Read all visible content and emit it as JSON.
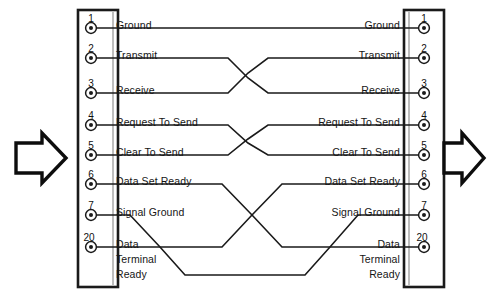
{
  "diagram": {
    "type": "null-modem-crossover-wiring",
    "background_color": "#ffffff",
    "line_color": "#1a1a1a",
    "text_color": "#151515"
  },
  "left_connector": {
    "name": "left-connector",
    "label": "DB-25 Connector (left)",
    "x": 78,
    "y": 10,
    "width": 40,
    "height": 277
  },
  "right_connector": {
    "name": "right-connector",
    "label": "DB-25 Connector (right)",
    "x": 404,
    "y": 10,
    "width": 40,
    "height": 277
  },
  "arrows": {
    "left": {
      "name": "left-direction-arrow",
      "direction": "right",
      "x": 14,
      "y": 133
    },
    "right": {
      "name": "right-direction-arrow",
      "direction": "right",
      "x": 440,
      "y": 133
    }
  },
  "pins": [
    {
      "number": "1",
      "label": "Ground",
      "y": 28,
      "multiline": false
    },
    {
      "number": "2",
      "label": "Transmit",
      "y": 58,
      "multiline": false
    },
    {
      "number": "3",
      "label": "Receive",
      "y": 93,
      "multiline": false
    },
    {
      "number": "4",
      "label": "Request To Send",
      "y": 125,
      "multiline": false
    },
    {
      "number": "5",
      "label": "Clear To Send",
      "y": 155,
      "multiline": false
    },
    {
      "number": "6",
      "label": "Data Set Ready",
      "y": 184,
      "multiline": false
    },
    {
      "number": "7",
      "label": "Signal Ground",
      "y": 215,
      "multiline": false
    },
    {
      "number": "20",
      "label": "Data Terminal Ready",
      "y": 247,
      "multiline": true,
      "lines": [
        "Data",
        "Terminal",
        "Ready"
      ]
    }
  ],
  "connections": [
    {
      "name": "wire-ground",
      "from_pin": "1",
      "to_pin": "1",
      "crossed": false
    },
    {
      "name": "wire-transmit",
      "from_pin": "2",
      "to_pin": "3",
      "crossed": true
    },
    {
      "name": "wire-receive",
      "from_pin": "3",
      "to_pin": "2",
      "crossed": true
    },
    {
      "name": "wire-request-to-send",
      "from_pin": "4",
      "to_pin": "5",
      "crossed": true
    },
    {
      "name": "wire-clear-to-send",
      "from_pin": "5",
      "to_pin": "4",
      "crossed": true
    },
    {
      "name": "wire-data-set-ready",
      "from_pin": "6",
      "to_pin": "20",
      "crossed": true
    },
    {
      "name": "wire-signal-ground",
      "from_pin": "7",
      "to_pin": "7",
      "crossed": false
    },
    {
      "name": "wire-data-terminal-ready",
      "from_pin": "20",
      "to_pin": "6",
      "crossed": true
    }
  ],
  "pin_numbers_left": [
    "1",
    "2",
    "3",
    "4",
    "5",
    "6",
    "7",
    "20"
  ],
  "pin_numbers_right": [
    "1",
    "2",
    "3",
    "4",
    "5",
    "6",
    "7",
    "20"
  ],
  "labels_left": [
    "Ground",
    "Transmit",
    "Receive",
    "Request To Send",
    "Clear To Send",
    "Data Set Ready",
    "Signal Ground",
    "Data"
  ],
  "labels_right": [
    "Ground",
    "Transmit",
    "Receive",
    "Request To Send",
    "Clear To Send",
    "Data Set Ready",
    "Signal Ground",
    "Data"
  ],
  "dtr_extra_lines": {
    "line2": "Terminal",
    "line3": "Ready"
  }
}
